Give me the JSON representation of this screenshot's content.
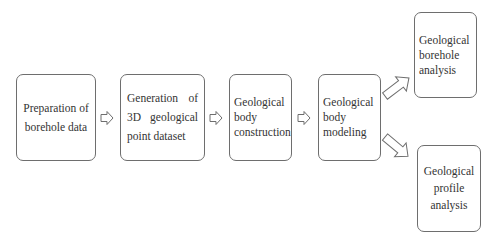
{
  "diagram": {
    "type": "flowchart",
    "nodes": [
      {
        "id": "prep",
        "label": "Preparation of borehole data"
      },
      {
        "id": "gen",
        "label": "Generation of 3D geological point dataset"
      },
      {
        "id": "construct",
        "label": "Geological body construction"
      },
      {
        "id": "model",
        "label": "Geological body modeling"
      },
      {
        "id": "borehole",
        "label": "Geological borehole analysis"
      },
      {
        "id": "profile",
        "label": "Geological profile analysis"
      }
    ],
    "edges": [
      {
        "from": "prep",
        "to": "gen"
      },
      {
        "from": "gen",
        "to": "construct"
      },
      {
        "from": "construct",
        "to": "model"
      },
      {
        "from": "model",
        "to": "borehole"
      },
      {
        "from": "model",
        "to": "profile"
      }
    ],
    "colors": {
      "border": "#6e6e6e",
      "text": "#333333",
      "background": "#ffffff"
    }
  }
}
